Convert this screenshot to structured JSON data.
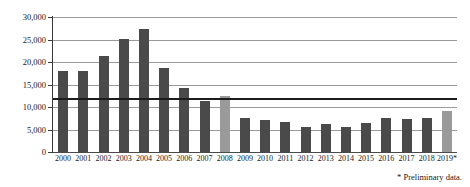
{
  "chart_data": {
    "type": "bar",
    "title": "",
    "subtitle": "",
    "xlabel": "",
    "ylabel": "",
    "ylim": [
      0,
      30000
    ],
    "yticks": [
      0,
      5000,
      10000,
      15000,
      20000,
      25000,
      30000
    ],
    "ytick_labels": [
      "0",
      "5,000",
      "10,000",
      "15,000",
      "20,000",
      "25,000",
      "30,000"
    ],
    "grid": true,
    "legend": "none",
    "categories": [
      "2000",
      "2001",
      "2002",
      "2003",
      "2004",
      "2005",
      "2006",
      "2007",
      "2008",
      "2009",
      "2010",
      "2011",
      "2012",
      "2013",
      "2014",
      "2015",
      "2016",
      "2017",
      "2018",
      "2019*"
    ],
    "values": [
      18100,
      18000,
      21300,
      25200,
      27300,
      18700,
      14200,
      11300,
      12400,
      7600,
      7100,
      6700,
      5600,
      6300,
      5600,
      6500,
      7600,
      7300,
      7600,
      9200
    ],
    "bar_colors": [
      "dark",
      "dark",
      "dark",
      "dark",
      "dark",
      "dark",
      "dark",
      "dark",
      "light",
      "dark",
      "dark",
      "dark",
      "dark",
      "dark",
      "dark",
      "dark",
      "dark",
      "dark",
      "dark",
      "light"
    ],
    "reference_line": {
      "value": 12000,
      "label": "",
      "color": "#1c1c1c"
    },
    "colors": {
      "bar_dark": "#4a4a4a",
      "bar_light": "#9a9a9a",
      "gridline": "#9b9b9b",
      "axis": "#3a3a3a",
      "text": "#1a1a1a",
      "background": "#ffffff"
    }
  },
  "footnote": {
    "text": "* Preliminary data."
  }
}
